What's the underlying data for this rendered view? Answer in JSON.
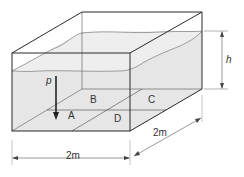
{
  "diagram": {
    "type": "tank-with-water",
    "labels": {
      "pressure": "p",
      "height": "h",
      "width": "2m",
      "depth": "2m",
      "regions": [
        "A",
        "B",
        "C",
        "D"
      ]
    },
    "colors": {
      "line": "#2a2a2a",
      "water": "#e6e6e6",
      "dim": "#555555"
    }
  }
}
